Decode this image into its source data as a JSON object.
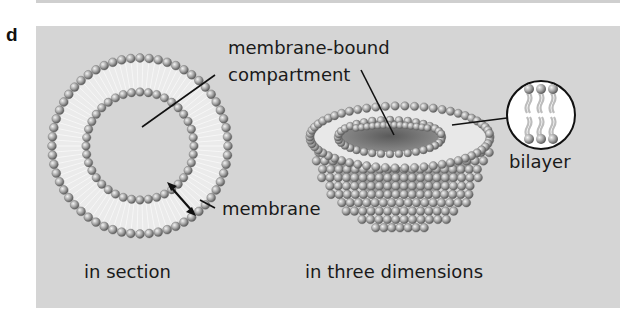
{
  "figure": {
    "panel_letter": "d",
    "background_color": "#d5d5d5",
    "labels": {
      "compartment_line1": "membrane-bound",
      "compartment_line2": "compartment",
      "membrane": "membrane",
      "bilayer": "bilayer",
      "in_section": "in section",
      "in_three_dimensions": "in three dimensions"
    },
    "elements": [
      {
        "name": "cross-section-vesicle",
        "description": "ring of two lipid layers shown in section"
      },
      {
        "name": "hemisphere-vesicle",
        "description": "half sphere of lipid heads in three dimensions"
      },
      {
        "name": "bilayer-inset",
        "description": "circular magnified view of lipid bilayer"
      }
    ]
  }
}
